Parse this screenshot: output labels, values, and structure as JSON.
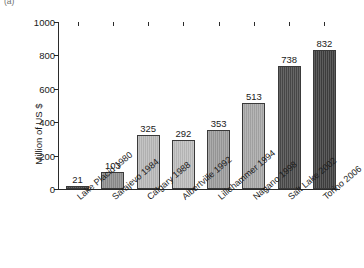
{
  "panel": {
    "label": "(a)"
  },
  "chart_data": {
    "type": "bar",
    "title": "",
    "subtitle": "",
    "xlabel": "",
    "ylabel": "Million of US $",
    "ylim": [
      0,
      1000
    ],
    "yticks": [
      0,
      200,
      400,
      600,
      800,
      1000
    ],
    "ytick_labels": [
      "0",
      "200",
      "400",
      "600",
      "800",
      "1000"
    ],
    "grid": false,
    "legend": null,
    "categories": [
      "Lake Placid 1980",
      "Sarajevo 1984",
      "Calgary 1988",
      "Albertville 1992",
      "Lillehammer 1994",
      "Nagano 1998",
      "Salt Lake 2002",
      "Torino 2006"
    ],
    "values": [
      21,
      103,
      325,
      292,
      353,
      513,
      738,
      832
    ],
    "value_labels": [
      "21",
      "103",
      "325",
      "292",
      "353",
      "513",
      "738",
      "832"
    ],
    "bar_colors": [
      "#4a4a4a",
      "#8e8e8e",
      "#b9b9b9",
      "#bdbdbd",
      "#9c9c9c",
      "#a8a8a8",
      "#4a4a4a",
      "#3f3f3f"
    ]
  }
}
